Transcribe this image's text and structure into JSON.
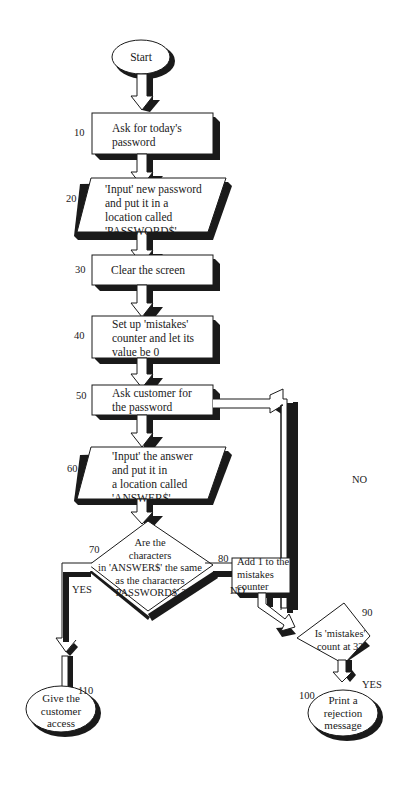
{
  "colors": {
    "ink": "#1a1a1a",
    "paper": "#ffffff",
    "shadow": "#1a1a1a"
  },
  "nodes": {
    "start": {
      "label": "Start"
    },
    "n10": {
      "number": "10",
      "lines": [
        "Ask for today's",
        "password"
      ]
    },
    "n20": {
      "number": "20",
      "lines": [
        "'Input' new password",
        "and put it in a",
        "location called",
        "'PASSWORD$'"
      ]
    },
    "n30": {
      "number": "30",
      "lines": [
        "Clear the screen"
      ]
    },
    "n40": {
      "number": "40",
      "lines": [
        "Set up 'mistakes'",
        "counter and let its",
        "value be 0"
      ]
    },
    "n50": {
      "number": "50",
      "lines": [
        "Ask customer for",
        "the password"
      ]
    },
    "n60": {
      "number": "60",
      "lines": [
        "'Input' the answer",
        "and put it in",
        "a location called",
        "'ANSWER$'"
      ]
    },
    "n70": {
      "number": "70",
      "lines": [
        "Are the",
        "characters",
        "in 'ANSWER$' the same",
        "as the characters",
        "'PASSWORD$' ?"
      ]
    },
    "n80": {
      "number": "80",
      "lines": [
        "Add 1 to the",
        "mistakes",
        "counter"
      ]
    },
    "n90": {
      "number": "90",
      "lines": [
        "Is 'mistakes'",
        "count at 3?"
      ]
    },
    "n100": {
      "number": "100",
      "lines": [
        "Print a",
        "rejection",
        "message"
      ]
    },
    "n110": {
      "number": "110",
      "lines": [
        "Give the",
        "customer",
        "access"
      ]
    }
  },
  "edges": {
    "n70_yes": "YES",
    "n70_no": "NO",
    "n90_yes": "YES",
    "n90_no": "NO"
  }
}
